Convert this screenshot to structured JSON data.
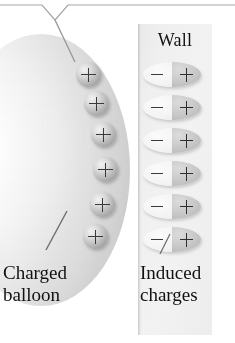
{
  "figure": {
    "type": "physics-illustration",
    "background_color": "#ffffff"
  },
  "wall": {
    "label": "Wall",
    "panel_color": "#eeeeee",
    "dipole_count": 6,
    "dipoles": [
      {
        "negative": "−",
        "positive": "+"
      },
      {
        "negative": "−",
        "positive": "+"
      },
      {
        "negative": "−",
        "positive": "+"
      },
      {
        "negative": "−",
        "positive": "+"
      },
      {
        "negative": "−",
        "positive": "+"
      },
      {
        "negative": "−",
        "positive": "+"
      }
    ]
  },
  "balloon": {
    "fill_color": "#e4e4e4",
    "charge_count": 6,
    "charge_sign": "+",
    "charges": [
      {
        "sign": "+"
      },
      {
        "sign": "+"
      },
      {
        "sign": "+"
      },
      {
        "sign": "+"
      },
      {
        "sign": "+"
      },
      {
        "sign": "+"
      }
    ]
  },
  "captions": {
    "balloon_line1": "Charged",
    "balloon_line2": "balloon",
    "induced_line1": "Induced",
    "induced_line2": "charges"
  },
  "annotations": {
    "top_callout": "bracket-leader-line",
    "balloon_leader": "diagonal-leader-line",
    "induced_leader": "diagonal-leader-line",
    "line_color": "#9a9a9a"
  }
}
